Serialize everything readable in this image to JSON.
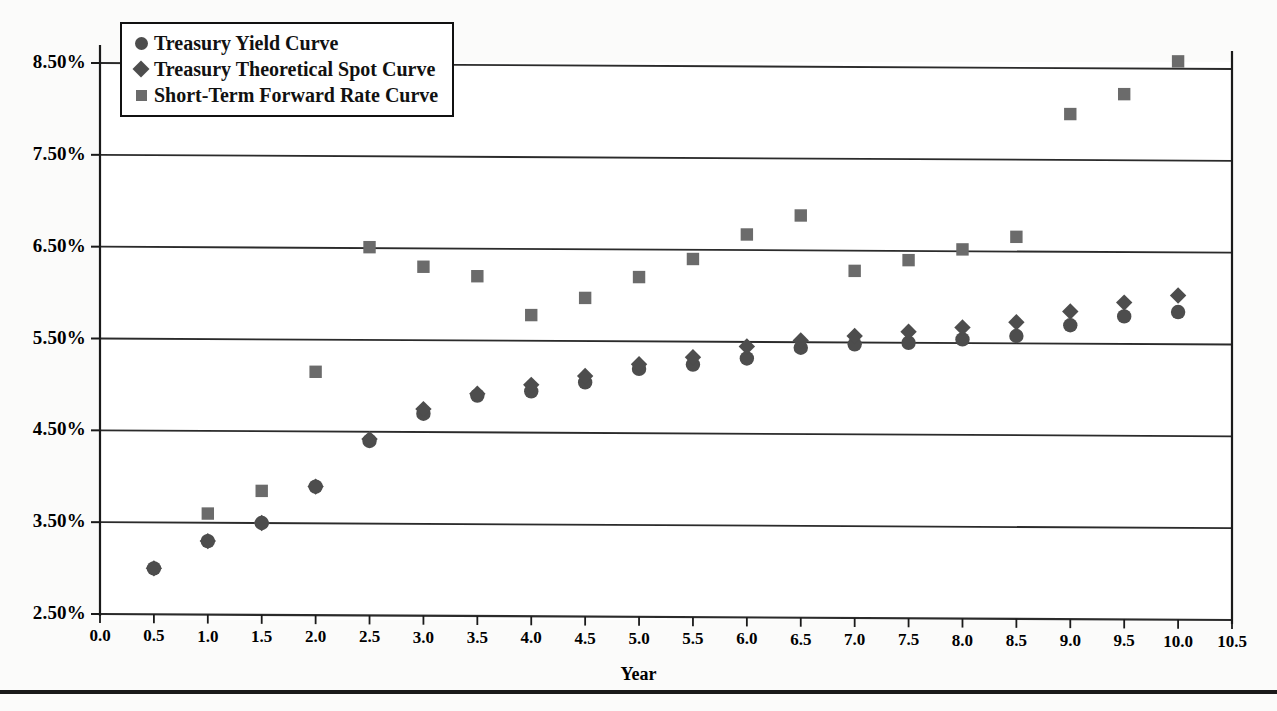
{
  "figure": {
    "background": "#fbfbfa",
    "plot_border_color": "#1a1a1a",
    "gridline_color": "#2b2b2b"
  },
  "axis_title_x": "Year",
  "legend": {
    "position": "top-left-inside",
    "entries": [
      {
        "label": "Treasury Yield Curve",
        "marker": "circle",
        "color": "#4d4d4d"
      },
      {
        "label": "Treasury Theoretical Spot Curve",
        "marker": "diamond",
        "color": "#4d4d4d"
      },
      {
        "label": "Short-Term Forward Rate Curve",
        "marker": "square",
        "color": "#6b6b6b"
      }
    ]
  },
  "chart_data": {
    "type": "scatter",
    "title": "",
    "xlabel": "Year",
    "ylabel": "",
    "xlim": [
      0.0,
      10.5
    ],
    "ylim": [
      2.5,
      8.5
    ],
    "grid": true,
    "xticks": [
      "0.0",
      "0.5",
      "1.0",
      "1.5",
      "2.0",
      "2.5",
      "3.0",
      "3.5",
      "4.0",
      "4.5",
      "5.0",
      "5.5",
      "6.0",
      "6.5",
      "7.0",
      "7.5",
      "8.0",
      "8.5",
      "9.0",
      "9.5",
      "10.0",
      "10.5"
    ],
    "xtickvals": [
      0.0,
      0.5,
      1.0,
      1.5,
      2.0,
      2.5,
      3.0,
      3.5,
      4.0,
      4.5,
      5.0,
      5.5,
      6.0,
      6.5,
      7.0,
      7.5,
      8.0,
      8.5,
      9.0,
      9.5,
      10.0,
      10.5
    ],
    "yticks": [
      "2.50%",
      "3.50%",
      "4.50%",
      "5.50%",
      "6.50%",
      "7.50%",
      "8.50%"
    ],
    "ytickvals": [
      2.5,
      3.5,
      4.5,
      5.5,
      6.5,
      7.5,
      8.5
    ],
    "x": [
      0.5,
      1.0,
      1.5,
      2.0,
      2.5,
      3.0,
      3.5,
      4.0,
      4.5,
      5.0,
      5.5,
      6.0,
      6.5,
      7.0,
      7.5,
      8.0,
      8.5,
      9.0,
      9.5,
      10.0
    ],
    "series": [
      {
        "name": "Treasury Yield Curve",
        "marker": "circle",
        "color": "#4d4d4d",
        "x": [
          0.5,
          1.0,
          1.5,
          2.0,
          2.5,
          3.0,
          3.5,
          4.0,
          4.5,
          5.0,
          5.5,
          6.0,
          6.5,
          7.0,
          7.5,
          8.0,
          8.5,
          9.0,
          9.5,
          10.0
        ],
        "values": [
          3.0,
          3.3,
          3.5,
          3.9,
          4.4,
          4.7,
          4.9,
          4.95,
          5.05,
          5.2,
          5.25,
          5.32,
          5.44,
          5.48,
          5.5,
          5.54,
          5.58,
          5.7,
          5.8,
          5.85
        ]
      },
      {
        "name": "Treasury Theoretical Spot Curve",
        "marker": "diamond",
        "color": "#4d4d4d",
        "x": [
          0.5,
          1.0,
          1.5,
          2.0,
          2.5,
          3.0,
          3.5,
          4.0,
          4.5,
          5.0,
          5.5,
          6.0,
          6.5,
          7.0,
          7.5,
          8.0,
          8.5,
          9.0,
          9.5,
          10.0
        ],
        "values": [
          3.0,
          3.3,
          3.5,
          3.9,
          4.42,
          4.75,
          4.92,
          5.02,
          5.12,
          5.25,
          5.33,
          5.45,
          5.52,
          5.57,
          5.62,
          5.67,
          5.73,
          5.85,
          5.95,
          6.03
        ]
      },
      {
        "name": "Short-Term Forward Rate Curve",
        "marker": "square",
        "color": "#6b6b6b",
        "x": [
          1.0,
          1.5,
          2.0,
          2.5,
          3.0,
          3.5,
          4.0,
          4.5,
          5.0,
          5.5,
          6.0,
          6.5,
          7.0,
          7.5,
          8.0,
          8.5,
          9.0,
          9.5,
          10.0
        ],
        "values": [
          3.6,
          3.85,
          5.15,
          6.51,
          6.3,
          6.2,
          5.78,
          5.97,
          6.2,
          6.4,
          6.67,
          6.88,
          6.28,
          6.4,
          6.52,
          6.66,
          8.0,
          8.22,
          8.58
        ]
      }
    ]
  }
}
